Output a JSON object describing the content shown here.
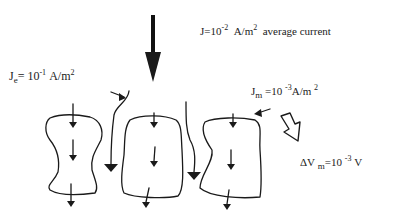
{
  "diagram": {
    "labels": {
      "average_current": {
        "symbol": "J",
        "eq": "=10",
        "exp": "-2",
        "unit": "A/m",
        "unit_exp": "2",
        "note": "average current"
      },
      "extracellular_current": {
        "symbol": "J",
        "sub": "e",
        "eq": "= 10",
        "exp": "-1",
        "unit": "A/m",
        "unit_exp": "2"
      },
      "membrane_current": {
        "symbol": "J",
        "sub": "m",
        "eq": "=10",
        "exp": "-3",
        "unit": "A/m",
        "unit_exp": "2"
      },
      "membrane_voltage": {
        "symbol": "ΔV",
        "sub": "m",
        "eq": "=10",
        "exp": "-3",
        "unit": "V"
      }
    },
    "elements": [
      "large downward arrow (average current)",
      "three cells with internal downward arrows",
      "extracellular current paths between cells",
      "hollow arrow pointing to membrane voltage"
    ]
  }
}
